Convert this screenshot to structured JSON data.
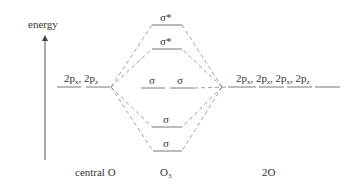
{
  "axis": {
    "label": "energy"
  },
  "columns": {
    "left": "central O",
    "middle_main": "O",
    "middle_sub": "3",
    "right": "2O"
  },
  "left_orbitals": {
    "label_a_main": "2p",
    "label_a_sub": "x",
    "sep": ", ",
    "label_b_main": "2p",
    "label_b_sub": "z"
  },
  "right_orbitals": {
    "items": [
      {
        "main": "2p",
        "sub": "x"
      },
      {
        "main": "2p",
        "sub": "z"
      },
      {
        "main": "2p",
        "sub": "x"
      },
      {
        "main": "2p",
        "sub": "z"
      }
    ],
    "sep": ", "
  },
  "mo_levels": {
    "antibonding_top": "σ*",
    "antibonding_2": "σ*",
    "nonbonding_1": "σ",
    "nonbonding_2": "σ",
    "bonding_1": "σ",
    "bonding_2": "σ"
  },
  "colors": {
    "line": "#555555",
    "dash": "#888888",
    "text": "#333333"
  }
}
